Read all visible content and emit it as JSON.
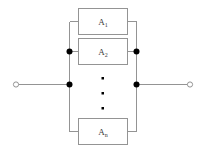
{
  "diagram": {
    "colors": {
      "background": "#ffffff",
      "wire": "#949494",
      "node": "#000000",
      "label": "#3a3a3a"
    },
    "blocks": [
      {
        "id": "block-1",
        "base": "A",
        "subscript": "1",
        "label": "A1"
      },
      {
        "id": "block-2",
        "base": "A",
        "subscript": "2",
        "label": "A2"
      },
      {
        "id": "block-n",
        "base": "A",
        "subscript": "n",
        "label": "An"
      }
    ],
    "ellipsis": {
      "name": "vertical-ellipsis",
      "dot_count": 3,
      "symbol": "⋮"
    },
    "terminals": [
      {
        "id": "terminal-left",
        "side": "left",
        "style": "open-circle"
      },
      {
        "id": "terminal-right",
        "side": "right",
        "style": "open-circle"
      }
    ],
    "junctions": [
      {
        "id": "junction-left-upper",
        "side": "left"
      },
      {
        "id": "junction-left-main",
        "side": "left"
      },
      {
        "id": "junction-right-upper",
        "side": "right"
      },
      {
        "id": "junction-right-main",
        "side": "right"
      }
    ]
  }
}
